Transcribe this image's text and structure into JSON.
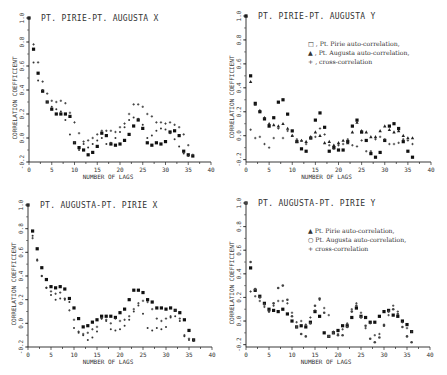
{
  "chart_data": [
    {
      "type": "scatter",
      "title": "PT. PIRIE-PT. AUGUSTA X",
      "xlabel": "NUMBER OF LAGS",
      "ylabel": "CORRELATION COEFFICIENT",
      "xlim": [
        0,
        40
      ],
      "ylim": [
        -0.2,
        1.0
      ],
      "xticks": [
        0,
        5,
        10,
        15,
        20,
        25,
        30,
        35,
        40
      ],
      "yticks": [
        "-0.2",
        "0.0",
        "0.2",
        "0.4",
        "0.6",
        "0.8",
        "1.0"
      ],
      "grid": false,
      "legend": [],
      "series": [
        {
          "name": "Pt. Pirie auto-correlation",
          "marker": "square",
          "values": [
            1.0,
            0.74,
            0.54,
            0.39,
            0.3,
            0.24,
            0.2,
            0.2,
            0.2,
            0.18,
            -0.04,
            -0.08,
            -0.1,
            -0.14,
            -0.12,
            -0.07,
            0.04,
            0.02,
            -0.05,
            -0.06,
            -0.05,
            -0.02,
            0.03,
            0.1,
            0.15,
            0.08,
            -0.04,
            -0.06,
            -0.04,
            -0.05,
            -0.03,
            0.05,
            0.06,
            0.02,
            -0.11,
            -0.14,
            -0.15
          ]
        },
        {
          "name": "Pt. Augusta auto-correlation",
          "marker": "plus",
          "values": [
            1.0,
            0.78,
            0.63,
            0.47,
            0.37,
            0.31,
            0.3,
            0.31,
            0.29,
            0.21,
            0.13,
            0.04,
            -0.03,
            -0.02,
            0.0,
            0.03,
            0.06,
            0.06,
            0.06,
            0.05,
            0.09,
            0.12,
            0.2,
            0.28,
            0.28,
            0.26,
            0.2,
            0.18,
            0.13,
            0.13,
            0.12,
            0.13,
            0.11,
            0.09,
            0.03,
            -0.06,
            -0.14
          ]
        },
        {
          "name": "cross-correlation",
          "marker": "dot",
          "values": [
            null,
            0.63,
            0.48,
            0.4,
            0.3,
            0.26,
            0.24,
            0.22,
            0.15,
            0.03,
            -0.04,
            -0.1,
            -0.05,
            -0.08,
            -0.05,
            -0.02,
            0.0,
            -0.05,
            -0.04,
            0.0,
            0.05,
            0.09,
            0.15,
            0.17,
            0.16,
            0.11,
            0.0,
            0.02,
            0.06,
            0.08,
            0.07,
            0.04,
            -0.01,
            -0.07,
            -0.13,
            -0.15,
            null
          ]
        }
      ]
    },
    {
      "type": "scatter",
      "title": "PT. PIRIE-PT. AUGUSTA Y",
      "xlabel": "NUMBER OF LAGS",
      "ylabel": "CORRELATION COEFFICIENT",
      "xlim": [
        0,
        40
      ],
      "ylim": [
        -0.22,
        1.0
      ],
      "xticks": [
        0,
        5,
        10,
        15,
        20,
        25,
        30,
        35,
        40
      ],
      "yticks": [
        "-0.2",
        "0.0",
        "0.2",
        "0.4",
        "0.6",
        "0.8",
        "1.0"
      ],
      "grid": false,
      "legend": [
        {
          "symbol": "□",
          "text": ", Pt. Pirie auto-correlation,"
        },
        {
          "symbol": "▲",
          "text": ", Pt. Augusta auto-correlation,"
        },
        {
          "symbol": "+",
          "text": ", cross-correlation"
        }
      ],
      "series": [
        {
          "name": "Pt. Pirie auto-correlation",
          "marker": "square",
          "values": [
            1.0,
            0.5,
            0.27,
            0.2,
            0.14,
            0.08,
            0.15,
            0.28,
            0.3,
            0.18,
            0.04,
            -0.05,
            -0.11,
            -0.13,
            -0.02,
            0.13,
            0.19,
            0.07,
            -0.13,
            -0.1,
            -0.12,
            -0.12,
            -0.05,
            0.08,
            0.13,
            0.03,
            -0.04,
            -0.15,
            -0.18,
            -0.14,
            -0.04,
            0.08,
            0.1,
            0.06,
            -0.05,
            -0.13,
            -0.18
          ]
        },
        {
          "name": "Pt. Augusta auto-correlation",
          "marker": "triangle",
          "values": [
            1.0,
            0.45,
            0.26,
            0.21,
            0.15,
            0.1,
            0.09,
            0.08,
            0.1,
            0.06,
            0.0,
            -0.05,
            -0.04,
            -0.05,
            -0.01,
            0.03,
            0.0,
            -0.06,
            -0.05,
            -0.08,
            -0.06,
            -0.04,
            -0.06,
            0.03,
            0.11,
            0.04,
            0.03,
            -0.01,
            -0.01,
            0.04,
            0.08,
            0.05,
            0.03,
            0.04,
            0.0,
            -0.02,
            -0.02
          ]
        },
        {
          "name": "cross-correlation",
          "marker": "plus",
          "values": [
            null,
            0.05,
            -0.02,
            -0.01,
            -0.07,
            -0.1,
            -0.02,
            0.06,
            -0.02,
            0.04,
            0.0,
            -0.03,
            -0.04,
            -0.07,
            -0.02,
            -0.01,
            0.06,
            0.01,
            -0.08,
            -0.11,
            -0.08,
            -0.07,
            -0.03,
            -0.08,
            -0.09,
            -0.04,
            -0.13,
            -0.13,
            -0.03,
            -0.01,
            -0.03,
            -0.07,
            -0.07,
            -0.06,
            -0.03,
            -0.04,
            -0.07
          ]
        }
      ]
    },
    {
      "type": "scatter",
      "title": "PT. AUGUSTA-PT. PIRIE X",
      "xlabel": "NUMBER OF LAGS",
      "ylabel": "CORRELATION COEFFICIENT",
      "xlim": [
        0,
        40
      ],
      "ylim": [
        -0.2,
        1.0
      ],
      "xticks": [
        0,
        5,
        10,
        15,
        20,
        25,
        30,
        35,
        40
      ],
      "yticks": [
        "-0.2",
        "0.0",
        "0.2",
        "0.4",
        "0.6",
        "0.8",
        "1.0"
      ],
      "grid": false,
      "legend": [],
      "series": [
        {
          "name": "Pt. Augusta auto-correlation",
          "marker": "square",
          "values": [
            1.0,
            0.78,
            0.63,
            0.47,
            0.37,
            0.31,
            0.3,
            0.31,
            0.29,
            0.21,
            0.13,
            0.04,
            -0.03,
            -0.02,
            0.01,
            0.03,
            0.06,
            0.06,
            0.06,
            0.05,
            0.09,
            0.12,
            0.2,
            0.28,
            0.28,
            0.26,
            0.2,
            0.18,
            0.13,
            0.13,
            0.12,
            0.13,
            0.11,
            0.09,
            0.03,
            -0.06,
            -0.14
          ]
        },
        {
          "name": "Pt. Pirie auto-correlation",
          "marker": "dot",
          "values": [
            1.0,
            0.74,
            0.54,
            0.4,
            0.3,
            0.24,
            0.2,
            0.21,
            0.2,
            0.18,
            -0.04,
            -0.08,
            -0.1,
            -0.14,
            -0.12,
            -0.07,
            0.04,
            0.02,
            -0.05,
            -0.06,
            -0.05,
            -0.02,
            0.03,
            0.1,
            0.15,
            0.08,
            -0.04,
            -0.06,
            -0.04,
            -0.05,
            -0.03,
            0.05,
            0.06,
            0.02,
            -0.11,
            -0.14,
            -0.15
          ]
        },
        {
          "name": "cross-correlation",
          "marker": "plus",
          "values": [
            null,
            0.72,
            0.53,
            0.4,
            0.3,
            0.27,
            0.25,
            0.26,
            0.21,
            0.11,
            0.03,
            -0.07,
            -0.09,
            -0.08,
            -0.05,
            -0.03,
            0.04,
            0.03,
            0.0,
            0.04,
            0.02,
            0.03,
            0.06,
            0.12,
            0.17,
            0.19,
            0.18,
            0.12,
            0.04,
            0.02,
            0.04,
            0.06,
            0.11,
            0.04,
            -0.1,
            -0.13,
            -0.14
          ]
        }
      ]
    },
    {
      "type": "scatter",
      "title": "PT. AUGUSTA-PT. PIRIE Y",
      "xlabel": "NUMBER OF LAGS",
      "ylabel": "CORRELATION COEFFICIENT",
      "xlim": [
        0,
        40
      ],
      "ylim": [
        -0.22,
        1.0
      ],
      "xticks": [
        0,
        5,
        10,
        15,
        20,
        25,
        30,
        35,
        40
      ],
      "yticks": [
        "-0.2",
        "0.0",
        "0.2",
        "0.4",
        "0.6",
        "0.8",
        "1.0"
      ],
      "grid": false,
      "legend": [
        {
          "symbol": "▲",
          "text": "Pt. Pirie auto-correlation,"
        },
        {
          "symbol": "○",
          "text": "Pt. Augusta auto-correlation,"
        },
        {
          "symbol": "+",
          "text": "cross-correlation"
        }
      ],
      "series": [
        {
          "name": "Pt. Pirie auto-correlation",
          "marker": "square",
          "values": [
            1.0,
            0.45,
            0.26,
            0.21,
            0.15,
            0.1,
            0.09,
            0.08,
            0.1,
            0.06,
            0.0,
            -0.05,
            -0.04,
            -0.05,
            -0.01,
            0.08,
            0.04,
            -0.1,
            -0.13,
            -0.1,
            -0.08,
            -0.04,
            -0.04,
            0.03,
            0.11,
            0.04,
            0.03,
            -0.01,
            -0.01,
            0.04,
            0.08,
            0.09,
            0.05,
            0.04,
            0.0,
            -0.03,
            -0.09
          ]
        },
        {
          "name": "Pt. Augusta auto-correlation",
          "marker": "circle",
          "values": [
            1.0,
            0.5,
            0.27,
            0.2,
            0.14,
            0.08,
            0.15,
            0.28,
            0.3,
            0.18,
            0.04,
            -0.05,
            -0.11,
            -0.13,
            -0.02,
            0.13,
            0.19,
            0.07,
            -0.13,
            -0.1,
            -0.12,
            -0.12,
            -0.05,
            0.08,
            0.13,
            0.03,
            -0.04,
            -0.15,
            -0.18,
            -0.14,
            -0.04,
            0.08,
            0.1,
            0.06,
            -0.05,
            -0.13,
            -0.18
          ]
        },
        {
          "name": "cross-correlation",
          "marker": "plus",
          "values": [
            null,
            0.25,
            0.21,
            0.17,
            0.12,
            0.09,
            0.13,
            0.17,
            0.17,
            0.15,
            0.07,
            -0.01,
            0.0,
            -0.03,
            0.03,
            0.09,
            0.18,
            0.11,
            0.05,
            -0.09,
            -0.11,
            -0.07,
            -0.02,
            0.1,
            0.15,
            0.07,
            -0.06,
            -0.02,
            -0.12,
            -0.11,
            -0.03,
            0.05,
            0.13,
            0.08,
            -0.01,
            -0.06,
            -0.09
          ]
        }
      ]
    }
  ]
}
